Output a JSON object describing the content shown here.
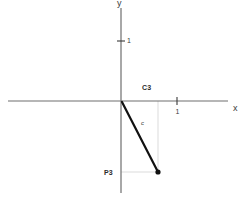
{
  "figure": {
    "width": 246,
    "height": 200,
    "background": "#ffffff"
  },
  "axes": {
    "x_label": "x",
    "y_label": "y",
    "axis_color": "#6e6e6e",
    "origin": {
      "x": 121,
      "y": 101
    },
    "x_axis": {
      "x1": 8,
      "y1": 101,
      "x2": 228,
      "y2": 101
    },
    "y_axis": {
      "x1": 121,
      "y1": 8,
      "x2": 121,
      "y2": 193
    },
    "ticks": [
      {
        "name": "x-tick-1",
        "label": "1",
        "x": 177,
        "y": 101,
        "orientation": "vertical"
      },
      {
        "name": "y-tick-1",
        "label": "1",
        "x": 121,
        "y": 41,
        "orientation": "horizontal"
      }
    ]
  },
  "annotations": {
    "c3_label": "C3",
    "p3_label": "P3",
    "vector_label": "c"
  },
  "guides": {
    "color": "#cccccc",
    "lines": [
      {
        "name": "vertical-guide",
        "x1": 158,
        "y1": 101,
        "x2": 158,
        "y2": 172
      },
      {
        "name": "horizontal-guide",
        "x1": 121,
        "y1": 172,
        "x2": 158,
        "y2": 172
      }
    ]
  },
  "vector": {
    "color": "#111111",
    "width": 2.2,
    "start": {
      "x": 122,
      "y": 102
    },
    "end": {
      "x": 158,
      "y": 172
    },
    "endpoint_radius": 2.6
  },
  "chart_data": {
    "type": "scatter",
    "title": "",
    "xlabel": "x",
    "ylabel": "y",
    "xlim": [
      -2,
      1.9
    ],
    "ylim": [
      -1.5,
      1.55
    ],
    "grid": false,
    "legend": null,
    "annotations": [
      {
        "text": "C3",
        "x": 0.35,
        "y": 0.17
      },
      {
        "text": "P3",
        "x": -0.3,
        "y": -1.1
      },
      {
        "text": "c",
        "x": 0.32,
        "y": -0.35
      }
    ],
    "series": [
      {
        "name": "c",
        "type": "vector",
        "from": [
          0,
          0
        ],
        "to": [
          0.66,
          -1.26
        ],
        "point_label": "P3"
      }
    ],
    "xticks": [
      1
    ],
    "yticks": [
      1
    ]
  }
}
